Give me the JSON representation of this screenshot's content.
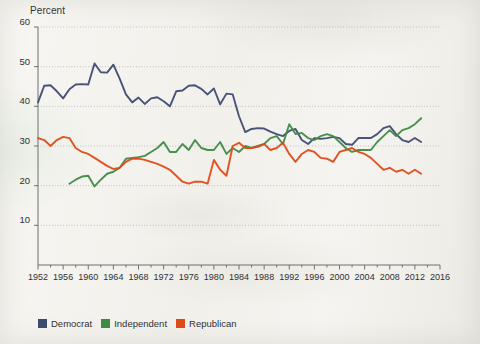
{
  "chart_data": {
    "type": "line",
    "title": "",
    "xlabel": "",
    "ylabel": "Percent",
    "xlim": [
      1952,
      2016
    ],
    "ylim": [
      0,
      60
    ],
    "yticks": [
      60,
      50,
      40,
      30,
      20,
      10
    ],
    "xticks": [
      1952,
      1956,
      1960,
      1964,
      1968,
      1972,
      1976,
      1980,
      1984,
      1988,
      1992,
      1996,
      2000,
      2004,
      2008,
      2012,
      2016
    ],
    "minor_xtick_step": 2,
    "grid": "horizontal-dotted",
    "legend_position": "below-left",
    "series": [
      {
        "name": "Democrat",
        "color": "#3f4a72",
        "x": [
          1952,
          1953,
          1954,
          1955,
          1956,
          1957,
          1958,
          1959,
          1960,
          1961,
          1962,
          1963,
          1964,
          1965,
          1966,
          1967,
          1968,
          1969,
          1970,
          1971,
          1972,
          1973,
          1974,
          1975,
          1976,
          1977,
          1978,
          1979,
          1980,
          1981,
          1982,
          1983,
          1984,
          1985,
          1986,
          1987,
          1988,
          1989,
          1990,
          1991,
          1992,
          1993,
          1994,
          1995,
          1996,
          1997,
          1998,
          1999,
          2000,
          2001,
          2002,
          2003,
          2004,
          2005,
          2006,
          2007,
          2008,
          2009,
          2010,
          2011,
          2012,
          2013
        ],
        "values": [
          41.0,
          45.2,
          45.3,
          43.8,
          42.0,
          44.3,
          45.5,
          45.6,
          45.5,
          50.8,
          48.6,
          48.5,
          50.5,
          47.0,
          43.0,
          41.0,
          42.2,
          40.6,
          42.0,
          42.3,
          41.3,
          40.0,
          43.8,
          44.0,
          45.2,
          45.3,
          44.4,
          43.0,
          44.5,
          40.5,
          43.2,
          43.0,
          37.5,
          33.5,
          34.3,
          34.5,
          34.4,
          33.6,
          33.0,
          32.5,
          33.8,
          34.3,
          31.5,
          30.5,
          32.0,
          31.8,
          32.0,
          32.3,
          32.0,
          30.5,
          30.3,
          32.0,
          32.0,
          32.0,
          33.0,
          34.5,
          35.0,
          33.0,
          31.5,
          31.0,
          32.0,
          31.0
        ]
      },
      {
        "name": "Independent",
        "color": "#3f8a46",
        "x": [
          1957,
          1958,
          1959,
          1960,
          1961,
          1962,
          1963,
          1964,
          1965,
          1966,
          1967,
          1968,
          1969,
          1970,
          1971,
          1972,
          1973,
          1974,
          1975,
          1976,
          1977,
          1978,
          1979,
          1980,
          1981,
          1982,
          1983,
          1984,
          1985,
          1986,
          1987,
          1988,
          1989,
          1990,
          1991,
          1992,
          1993,
          1994,
          1995,
          1996,
          1997,
          1998,
          1999,
          2000,
          2001,
          2002,
          2003,
          2004,
          2005,
          2006,
          2007,
          2008,
          2009,
          2010,
          2011,
          2012,
          2013
        ],
        "values": [
          20.5,
          21.5,
          22.3,
          22.5,
          19.8,
          21.5,
          23.0,
          23.5,
          24.5,
          26.8,
          27.0,
          27.2,
          27.5,
          28.5,
          29.5,
          31.0,
          28.5,
          28.5,
          30.5,
          29.0,
          31.5,
          29.5,
          29.0,
          29.0,
          31.0,
          28.0,
          29.5,
          28.5,
          30.0,
          29.5,
          30.0,
          30.5,
          32.0,
          32.5,
          30.5,
          35.5,
          33.0,
          33.3,
          32.0,
          31.5,
          32.5,
          33.0,
          32.5,
          31.0,
          29.5,
          28.5,
          29.0,
          29.0,
          29.0,
          31.0,
          32.5,
          34.0,
          32.5,
          34.0,
          34.5,
          35.5,
          37.0
        ]
      },
      {
        "name": "Republican",
        "color": "#e04a18",
        "x": [
          1952,
          1953,
          1954,
          1955,
          1956,
          1957,
          1958,
          1959,
          1960,
          1961,
          1962,
          1963,
          1964,
          1965,
          1966,
          1967,
          1968,
          1969,
          1970,
          1971,
          1972,
          1973,
          1974,
          1975,
          1976,
          1977,
          1978,
          1979,
          1980,
          1981,
          1982,
          1983,
          1984,
          1985,
          1986,
          1987,
          1988,
          1989,
          1990,
          1991,
          1992,
          1993,
          1994,
          1995,
          1996,
          1997,
          1998,
          1999,
          2000,
          2001,
          2002,
          2003,
          2004,
          2005,
          2006,
          2007,
          2008,
          2009,
          2010,
          2011,
          2012,
          2013
        ],
        "values": [
          32.0,
          31.5,
          30.0,
          31.5,
          32.3,
          32.0,
          29.5,
          28.5,
          28.0,
          27.0,
          26.0,
          25.0,
          24.2,
          24.5,
          26.0,
          26.8,
          26.8,
          26.5,
          26.0,
          25.5,
          24.8,
          24.0,
          22.5,
          21.0,
          20.5,
          21.0,
          21.0,
          20.5,
          26.5,
          24.0,
          22.5,
          30.0,
          30.8,
          29.5,
          29.5,
          29.8,
          30.5,
          29.0,
          29.5,
          30.8,
          28.0,
          26.0,
          28.0,
          29.0,
          28.5,
          27.0,
          26.8,
          26.0,
          28.5,
          29.0,
          29.5,
          28.5,
          28.0,
          27.0,
          25.5,
          24.0,
          24.5,
          23.5,
          24.0,
          23.0,
          24.0,
          23.0
        ]
      }
    ]
  },
  "legend": {
    "items": [
      {
        "label": "Democrat",
        "color": "#3f4a72"
      },
      {
        "label": "Independent",
        "color": "#3f8a46"
      },
      {
        "label": "Republican",
        "color": "#e04a18"
      }
    ]
  },
  "axis": {
    "y_axis_title": "Percent"
  }
}
